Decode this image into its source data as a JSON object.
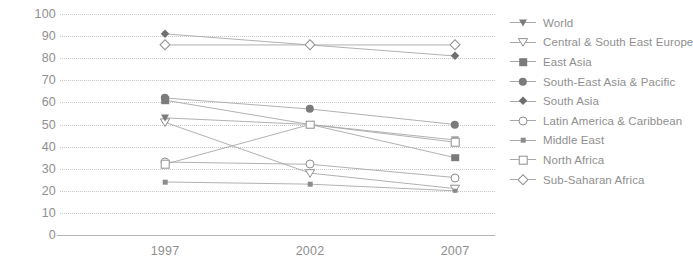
{
  "chart_data": {
    "type": "line",
    "title": "",
    "subtitle": "",
    "xlabel": "",
    "ylabel": "",
    "x": [
      "1997",
      "2002",
      "2007"
    ],
    "categories": [
      "1997",
      "2002",
      "2007"
    ],
    "xtick_labels": [
      "1997",
      "2002",
      "2007"
    ],
    "ytick_labels": [
      "100",
      "90",
      "80",
      "70",
      "60",
      "50",
      "40",
      "30",
      "20",
      "10",
      "0"
    ],
    "yticks": [
      100,
      90,
      80,
      70,
      60,
      50,
      40,
      30,
      20,
      10,
      0
    ],
    "ylim": [
      0,
      100
    ],
    "ystep": 10,
    "grid": "horizontal-dotted",
    "legend_position": "right",
    "series": [
      {
        "name": "World",
        "marker": "triangle-down-filled",
        "values": [
          53,
          50,
          43
        ]
      },
      {
        "name": "Central & South East Europe",
        "marker": "triangle-down-open",
        "values": [
          51,
          28,
          21
        ]
      },
      {
        "name": "East Asia",
        "marker": "square-filled",
        "values": [
          61,
          50,
          35
        ]
      },
      {
        "name": "South-East Asia & Pacific",
        "marker": "circle-filled",
        "values": [
          62,
          57,
          50
        ]
      },
      {
        "name": "South Asia",
        "marker": "diamond-filled",
        "values": [
          91,
          86,
          81
        ]
      },
      {
        "name": "Latin America & Caribbean",
        "marker": "circle-open",
        "values": [
          33,
          32,
          26
        ]
      },
      {
        "name": "Middle East",
        "marker": "square-small-filled",
        "values": [
          24,
          23,
          20
        ]
      },
      {
        "name": "North Africa",
        "marker": "square-open",
        "values": [
          32,
          50,
          42
        ]
      },
      {
        "name": "Sub-Saharan Africa",
        "marker": "diamond-open",
        "values": [
          86,
          86,
          86
        ]
      }
    ]
  },
  "legend": {
    "items": [
      {
        "label": "World"
      },
      {
        "label": "Central & South East Europe"
      },
      {
        "label": "East Asia"
      },
      {
        "label": "South-East Asia & Pacific"
      },
      {
        "label": "South Asia"
      },
      {
        "label": "Latin America & Caribbean"
      },
      {
        "label": "Middle East"
      },
      {
        "label": "North Africa"
      },
      {
        "label": "Sub-Saharan Africa"
      }
    ]
  },
  "colors": {
    "line": "#a8a8a8",
    "marker_fill": "#7b7b7b",
    "marker_open_fill": "#ffffff",
    "marker_stroke": "#8f8f8f",
    "grid": "#c9c9c9",
    "axis": "#b4b4b4",
    "text": "#8f8f8f",
    "background": "#ffffff"
  }
}
